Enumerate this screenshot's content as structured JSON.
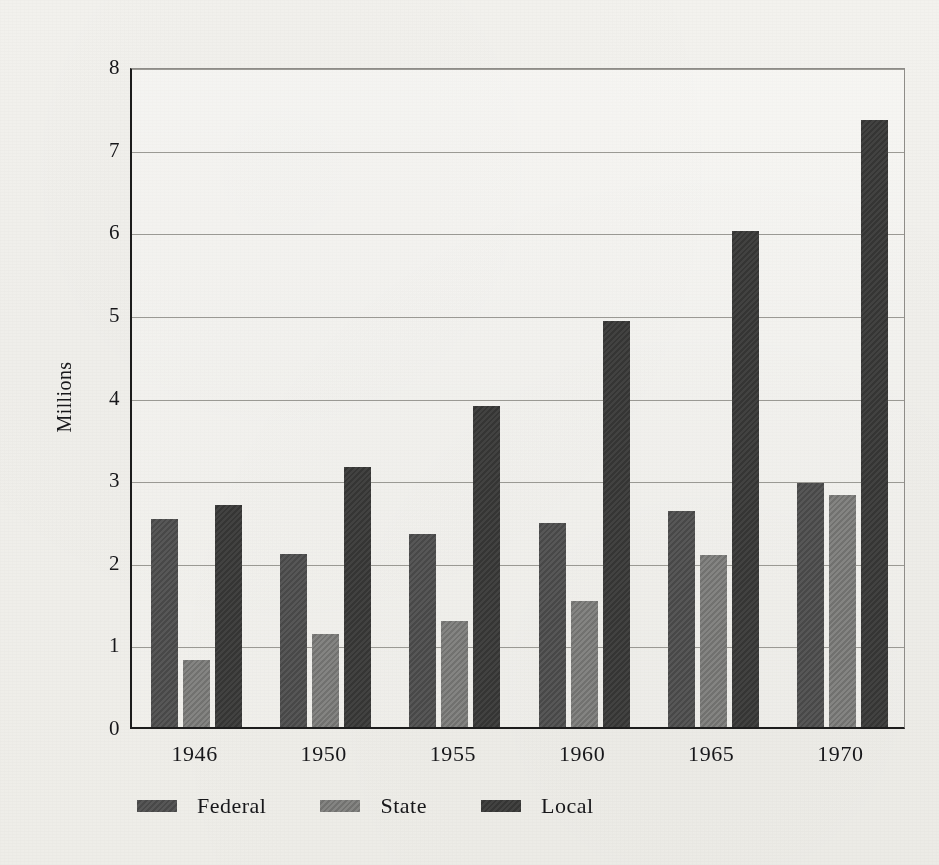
{
  "chart_data": {
    "type": "bar",
    "title": "",
    "subtitle": "",
    "xlabel": "",
    "ylabel": "Millions",
    "categories": [
      "1946",
      "1950",
      "1955",
      "1960",
      "1965",
      "1970"
    ],
    "series": [
      {
        "name": "Federal",
        "color": "#4c4c4c",
        "values": [
          2.52,
          2.09,
          2.33,
          2.47,
          2.62,
          2.95
        ]
      },
      {
        "name": "State",
        "color": "#767674",
        "values": [
          0.81,
          1.12,
          1.28,
          1.52,
          2.08,
          2.81
        ]
      },
      {
        "name": "Local",
        "color": "#383837",
        "values": [
          2.69,
          3.15,
          3.89,
          4.92,
          6.0,
          7.35
        ]
      }
    ],
    "ylim": [
      0,
      8
    ],
    "ytick_labels": [
      "0",
      "1",
      "2",
      "3",
      "4",
      "5",
      "6",
      "7",
      "8"
    ],
    "grid": true,
    "legend_position": "bottom-left"
  },
  "axis": {
    "y_title": "Millions",
    "y_ticks": [
      "8",
      "7",
      "6",
      "5",
      "4",
      "3",
      "2",
      "1",
      "0"
    ],
    "x_ticks": [
      "1946",
      "1950",
      "1955",
      "1960",
      "1965",
      "1970"
    ]
  },
  "legend": {
    "items": [
      {
        "label": "Federal",
        "swatch": "federal-swatch"
      },
      {
        "label": "State",
        "swatch": "state-swatch"
      },
      {
        "label": "Local",
        "swatch": "local-swatch"
      }
    ]
  },
  "colors": {
    "federal": "#4c4c4c",
    "state": "#767674",
    "local": "#383837",
    "axis": "#1c1c1c",
    "grid": "#8b8984",
    "paper": "#f1f0ec"
  }
}
